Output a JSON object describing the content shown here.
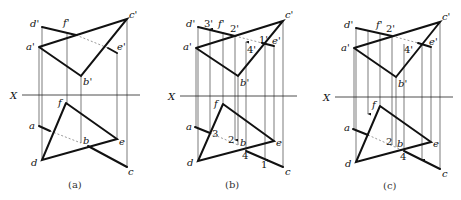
{
  "figure": {
    "axis_label": "X",
    "panels": [
      {
        "id": "a",
        "caption": "(a)",
        "front_labels": {
          "d": "d'",
          "f": "f'",
          "c": "c'",
          "a": "a'",
          "e": "e'",
          "b": "b'"
        },
        "top_labels": {
          "f": "f",
          "a": "a",
          "b": "b",
          "e": "e",
          "d": "d",
          "c": "c"
        }
      },
      {
        "id": "b",
        "caption": "(b)",
        "front_labels": {
          "d": "d'",
          "p3": "3'",
          "f": "f'",
          "p2": "2'",
          "c": "c'",
          "a": "a'",
          "p4": "4'",
          "p1": "1'",
          "e": "e'",
          "b": "b'"
        },
        "top_labels": {
          "f": "f",
          "a": "a",
          "p3": "3",
          "p2": "2",
          "b": "b",
          "e": "e",
          "d": "d",
          "p4": "4",
          "p1": "1",
          "c": "c"
        }
      },
      {
        "id": "c",
        "caption": "(c)",
        "front_labels": {
          "d": "d'",
          "f": "f'",
          "p2": "2'",
          "c": "c'",
          "a": "a'",
          "p4": "4'",
          "e": "e'",
          "b": "b'"
        },
        "top_labels": {
          "f": "f",
          "a": "a",
          "p2": "2",
          "b": "b",
          "e": "e",
          "d": "d",
          "p4": "4",
          "c": "c"
        }
      }
    ]
  }
}
